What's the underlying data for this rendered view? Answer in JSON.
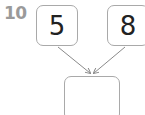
{
  "question": {
    "number": "10"
  },
  "diagram": {
    "inputs": [
      {
        "value": "5"
      },
      {
        "value": "8"
      }
    ],
    "output": {
      "value": ""
    },
    "colors": {
      "border": "#a9a9a9",
      "arrow": "#8a8a8a",
      "text": "#222222",
      "number": "#9a9a9a"
    }
  }
}
